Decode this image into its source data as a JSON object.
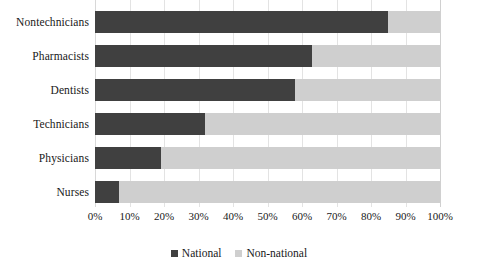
{
  "chart_data": {
    "type": "bar",
    "subtype": "stacked-horizontal-100-percent",
    "title": "",
    "xlabel": "",
    "ylabel": "",
    "categories": [
      "Nontechnicians",
      "Pharmacists",
      "Dentists",
      "Technicians",
      "Physicians",
      "Nurses"
    ],
    "series": [
      {
        "name": "National",
        "color": "#404040",
        "values": [
          85,
          63,
          58,
          32,
          19,
          7
        ]
      },
      {
        "name": "Non-national",
        "color": "#cfcfcf",
        "values": [
          15,
          37,
          42,
          68,
          81,
          93
        ]
      }
    ],
    "xlim": [
      0,
      100
    ],
    "xticks": [
      0,
      10,
      20,
      30,
      40,
      50,
      60,
      70,
      80,
      90,
      100
    ],
    "xtick_labels": [
      "0%",
      "10%",
      "20%",
      "30%",
      "40%",
      "50%",
      "60%",
      "70%",
      "80%",
      "90%",
      "100%"
    ],
    "grid": true,
    "grid_axis": "x",
    "legend_position": "bottom",
    "legend_entries": [
      "National",
      "Non-national"
    ],
    "units": "percent",
    "background_color": "#ffffff"
  }
}
